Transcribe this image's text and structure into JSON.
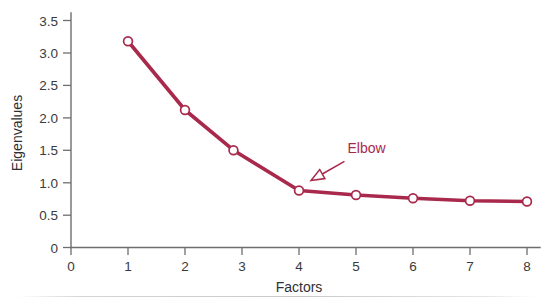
{
  "chart_data": {
    "type": "line",
    "title": "",
    "subtitle": "",
    "xlabel": "Factors",
    "ylabel": "Eigenvalues",
    "xlim": [
      0,
      8
    ],
    "ylim": [
      0,
      3.5
    ],
    "grid": false,
    "legend": "none",
    "x_ticks": [
      "0",
      "1",
      "2",
      "3",
      "4",
      "5",
      "6",
      "7",
      "8"
    ],
    "x_tick_values": [
      0,
      1,
      2,
      3,
      4,
      5,
      6,
      7,
      8
    ],
    "y_ticks": [
      "0",
      "0.5",
      "1.0",
      "1.5",
      "2.0",
      "2.5",
      "3.0",
      "3.5"
    ],
    "y_tick_values": [
      0,
      0.5,
      1.0,
      1.5,
      2.0,
      2.5,
      3.0,
      3.5
    ],
    "series": [
      {
        "name": "Eigenvalues",
        "color": "#a8294c",
        "marker": "open-circle",
        "x": [
          1,
          2,
          2.85,
          4,
          5,
          6,
          7,
          8
        ],
        "values": [
          3.18,
          2.12,
          1.5,
          0.88,
          0.81,
          0.76,
          0.72,
          0.71
        ]
      }
    ],
    "annotations": [
      {
        "label": "Elbow",
        "color": "#a8294c",
        "text_x": 4.85,
        "text_y": 1.45,
        "points_to_x": 4,
        "points_to_y": 0.88,
        "arrow_style": "open-triangle"
      }
    ]
  },
  "colors": {
    "series": "#a8294c",
    "axis": "#6e6e70",
    "text": "#2f2f31",
    "background": "#ffffff",
    "footer_rule": "#c9c9cb"
  }
}
